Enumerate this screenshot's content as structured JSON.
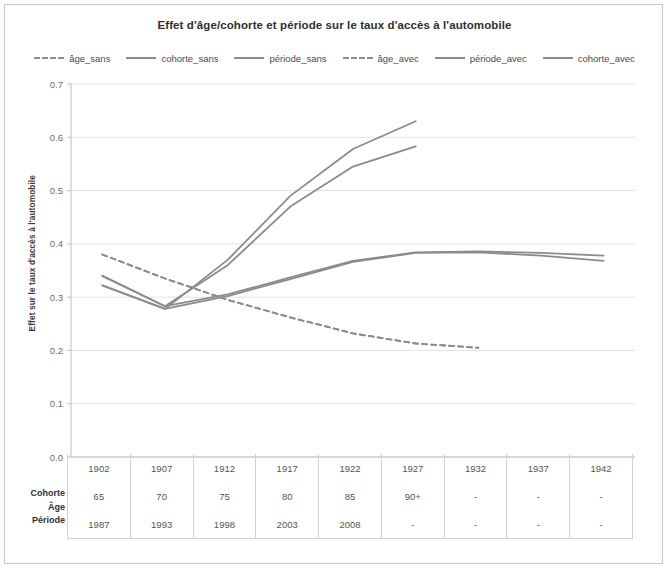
{
  "chart_data": {
    "type": "line",
    "title": "Effet d'âge/cohorte et période sur le taux d'accès à l'automobile",
    "xlabel": "",
    "ylabel": "Effet sur le taux d'accès à l'automobile",
    "ylim": [
      0.0,
      0.7
    ],
    "yticks": [
      "0.0",
      "0.1",
      "0.2",
      "0.3",
      "0.4",
      "0.5",
      "0.6",
      "0.7"
    ],
    "grid": true,
    "legend_position": "top",
    "x": [
      1902,
      1907,
      1912,
      1917,
      1922,
      1927,
      1932,
      1937,
      1942
    ],
    "series": [
      {
        "name": "âge_sans",
        "style": "dashed",
        "color": "#8b8b8b",
        "values": [
          0.38,
          0.335,
          0.295,
          0.262,
          0.232,
          0.213,
          0.205,
          null,
          null
        ]
      },
      {
        "name": "cohorte_sans",
        "style": "solid",
        "color": "#8b8b8b",
        "values": [
          0.34,
          0.283,
          0.36,
          0.47,
          0.545,
          0.583,
          null,
          null,
          null
        ]
      },
      {
        "name": "période_sans",
        "style": "solid",
        "color": "#8b8b8b",
        "values": [
          0.322,
          0.278,
          0.37,
          0.49,
          0.578,
          0.63,
          null,
          null,
          null
        ]
      },
      {
        "name": "âge_avec",
        "style": "dashed",
        "color": "#8b8b8b",
        "values": [
          0.38,
          0.335,
          0.295,
          0.262,
          0.232,
          0.213,
          0.205,
          null,
          null
        ]
      },
      {
        "name": "période_avec",
        "style": "solid",
        "color": "#8b8b8b",
        "values": [
          0.34,
          0.283,
          0.305,
          0.337,
          0.368,
          0.384,
          0.386,
          0.383,
          0.378
        ]
      },
      {
        "name": "cohorte_avec",
        "style": "solid",
        "color": "#8b8b8b",
        "values": [
          0.322,
          0.278,
          0.302,
          0.334,
          0.366,
          0.383,
          0.384,
          0.378,
          0.368
        ]
      }
    ]
  },
  "legend": [
    {
      "label": "âge_sans",
      "style": "dashed"
    },
    {
      "label": "cohorte_sans",
      "style": "solid"
    },
    {
      "label": "période_sans",
      "style": "solid"
    },
    {
      "label": "âge_avec",
      "style": "dashed"
    },
    {
      "label": "période_avec",
      "style": "solid"
    },
    {
      "label": "cohorte_avec",
      "style": "solid"
    }
  ],
  "table": {
    "row_labels": [
      "Cohorte",
      "Âge",
      "Période"
    ],
    "rows": [
      {
        "label": "Cohorte",
        "cells": [
          "1902",
          "1907",
          "1912",
          "1917",
          "1922",
          "1927",
          "1932",
          "1937",
          "1942"
        ]
      },
      {
        "label": "Âge",
        "cells": [
          "65",
          "70",
          "75",
          "80",
          "85",
          "90+",
          "-",
          "-",
          "-"
        ]
      },
      {
        "label": "Période",
        "cells": [
          "1987",
          "1993",
          "1998",
          "2003",
          "2008",
          "-",
          "-",
          "-",
          "-"
        ]
      }
    ]
  },
  "colors": {
    "line": "#8b8b8b",
    "grid": "#e2e2e2",
    "axis": "#bdbdbd",
    "text": "#555555",
    "frame": "#c9c9c9"
  }
}
